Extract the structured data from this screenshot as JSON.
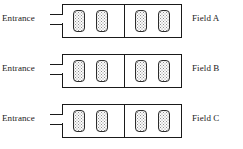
{
  "diagram": {
    "type": "schematic-plan-view",
    "background_color": "#ffffff",
    "line_color": "#1a1a1a",
    "plot_fill_pattern": "stippled-dots",
    "plot_fill_color": "#fbfbfb",
    "plot_dot_color": "#8e8e8e"
  },
  "rows": [
    {
      "entrance_label": "Entrance",
      "field_label": "Field A",
      "halves": [
        {
          "plots": [
            "plot",
            "plot"
          ]
        },
        {
          "plots": [
            "plot",
            "plot"
          ]
        }
      ]
    },
    {
      "entrance_label": "Entrance",
      "field_label": "Field B",
      "halves": [
        {
          "plots": [
            "plot",
            "plot"
          ]
        },
        {
          "plots": [
            "plot",
            "plot"
          ]
        }
      ]
    },
    {
      "entrance_label": "Entrance",
      "field_label": "Field C",
      "halves": [
        {
          "plots": [
            "plot",
            "plot"
          ]
        },
        {
          "plots": [
            "plot",
            "plot"
          ]
        }
      ]
    }
  ]
}
